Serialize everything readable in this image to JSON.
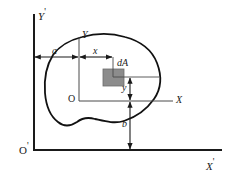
{
  "figure": {
    "colors": {
      "line": "#1a1a1a",
      "outline": "#111111",
      "element_fill": "#8c8c8c",
      "element_stroke": "#6b6b6b",
      "background": "#ffffff"
    },
    "axes": {
      "outer": {
        "origin_label": "O",
        "origin_prime": "'",
        "x_label": "X",
        "x_prime": "'",
        "y_label": "Y",
        "y_prime": "'"
      },
      "inner": {
        "origin_label": "O",
        "x_label": "X",
        "y_label": "Y"
      }
    },
    "element": {
      "label": "dA"
    },
    "dimensions": [
      {
        "name": "a",
        "label": "a",
        "orientation": "horizontal"
      },
      {
        "name": "x",
        "label": "x",
        "orientation": "horizontal"
      },
      {
        "name": "y",
        "label": "y",
        "orientation": "vertical"
      },
      {
        "name": "b",
        "label": "b",
        "orientation": "vertical"
      }
    ]
  }
}
